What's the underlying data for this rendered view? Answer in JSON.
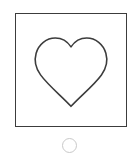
{
  "canvas": {
    "width": 139,
    "height": 162,
    "background_color": "#ffffff"
  },
  "shape_frame": {
    "name": "shape-frame",
    "border_color": "#3c3c3c",
    "fill_color": "#ffffff",
    "border_width_px": 1.5,
    "x": 15,
    "y": 13,
    "width": 112,
    "height": 114
  },
  "shape": {
    "name": "heart",
    "icon_name": "heart-icon",
    "label": "Heart",
    "stroke_color": "#3c3c3c",
    "fill_color": "none",
    "stroke_width_px": 1.6,
    "bounds": {
      "left": 19,
      "top": 18,
      "right": 93,
      "bottom": 94
    }
  },
  "selector": {
    "name": "selector-circle",
    "label": "Select shape",
    "state": "unselected",
    "stroke_color": "#c9c9c9",
    "fill_color": "none",
    "stroke_width_px": 1.5,
    "diameter_px": 15,
    "center_x": 71,
    "center_y": 145
  }
}
